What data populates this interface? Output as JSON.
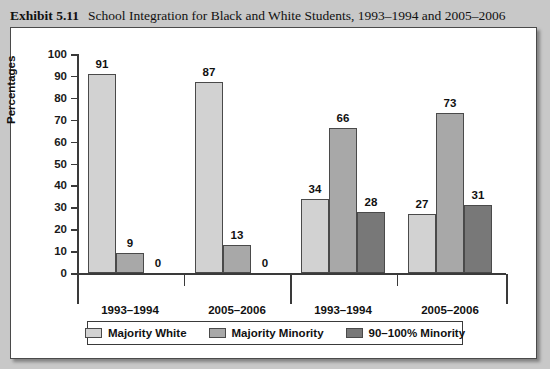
{
  "caption": {
    "exhibit_label": "Exhibit 5.11",
    "title": "School Integration for Black and White Students, 1993–1994 and 2005–2006"
  },
  "chart_data": {
    "type": "bar",
    "title": "School Integration for Black and White Students, 1993–1994 and 2005–2006",
    "xlabel": "",
    "ylabel": "Percentages",
    "ylim": [
      0,
      100
    ],
    "ytick_step": 10,
    "yticks": [
      0,
      10,
      20,
      30,
      40,
      50,
      60,
      70,
      80,
      90,
      100
    ],
    "grid": false,
    "legend_position": "bottom",
    "group_labels": [
      "White",
      "Black"
    ],
    "categories": [
      "1993–1994",
      "2005–2006",
      "1993–1994",
      "2005–2006"
    ],
    "category_groups": [
      "White",
      "White",
      "Black",
      "Black"
    ],
    "series": [
      {
        "name": "Majority White",
        "color": "#d2d2d2",
        "values": [
          91,
          87,
          34,
          27
        ]
      },
      {
        "name": "Majority Minority",
        "color": "#a8a8a8",
        "values": [
          9,
          13,
          66,
          73
        ]
      },
      {
        "name": "90–100% Minority",
        "color": "#787878",
        "values": [
          0,
          0,
          28,
          31
        ]
      }
    ]
  },
  "colors": {
    "page_background": "#c8c8c8",
    "panel_background": "#ffffff",
    "frame_border": "#4a4a4a",
    "axis": "#3a3a3a",
    "text": "#111111"
  }
}
